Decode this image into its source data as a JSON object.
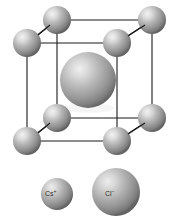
{
  "figure": {
    "background_color": "#ffffff",
    "edge_color": "#1a1a1a",
    "sphere_base_color": "#8f8f8f",
    "sphere_highlight_color": "#e8e8e8",
    "sphere_shadow_color": "#4d4d4d"
  },
  "structure": {
    "cell_type": "cube",
    "corner_ion": "Cs+",
    "center_ion": "Cl-",
    "corner_count": 8,
    "center_count": 1,
    "corner_radius": 14,
    "center_radius": 28,
    "corners": [
      {
        "name": "back-top-left",
        "cx": 57,
        "cy": 20
      },
      {
        "name": "back-top-right",
        "cx": 152,
        "cy": 20
      },
      {
        "name": "front-top-left",
        "cx": 27,
        "cy": 43
      },
      {
        "name": "front-top-right",
        "cx": 117,
        "cy": 43
      },
      {
        "name": "back-bottom-left",
        "cx": 57,
        "cy": 118
      },
      {
        "name": "back-bottom-right",
        "cx": 152,
        "cy": 118
      },
      {
        "name": "front-bottom-left",
        "cx": 27,
        "cy": 141
      },
      {
        "name": "front-bottom-right",
        "cx": 117,
        "cy": 141
      }
    ],
    "center": {
      "name": "center-anion",
      "cx": 88,
      "cy": 80
    }
  },
  "legend": {
    "items": [
      {
        "name": "cs-cation",
        "symbol": "Cs",
        "charge": "+",
        "label": "Cs+",
        "cx": 57,
        "cy": 194,
        "r": 16
      },
      {
        "name": "cl-anion",
        "symbol": "Cl",
        "charge": "−",
        "label": "Cl−",
        "cx": 116,
        "cy": 192,
        "r": 24
      }
    ]
  }
}
